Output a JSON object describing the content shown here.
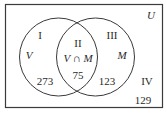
{
  "diagram": {
    "type": "venn",
    "universe_label": "U",
    "sets": [
      {
        "name": "V",
        "label": "V"
      },
      {
        "name": "M",
        "label": "M"
      }
    ],
    "regions": [
      {
        "id": "I",
        "roman": "I",
        "description": "V only",
        "value": "273"
      },
      {
        "id": "II",
        "roman": "II",
        "description": "V ∩ M",
        "set_label": "V ∩ M",
        "value": "75"
      },
      {
        "id": "III",
        "roman": "III",
        "description": "M only",
        "value": "123"
      },
      {
        "id": "IV",
        "roman": "IV",
        "description": "outside V and M",
        "value": "129"
      }
    ],
    "colors": {
      "stroke": "#3a3a3a",
      "text": "#2a2a2a",
      "background": "#ffffff"
    }
  }
}
